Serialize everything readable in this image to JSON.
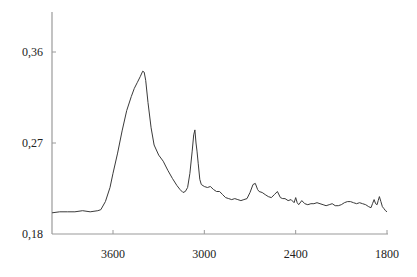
{
  "chart_data": {
    "type": "line",
    "title": "",
    "xlabel": "",
    "ylabel": "",
    "x_reversed": true,
    "xlim": [
      4000,
      1800
    ],
    "ylim": [
      0.18,
      0.39
    ],
    "grid": false,
    "legend": "none",
    "x_ticks": [
      3600,
      3000,
      2400,
      1800
    ],
    "x_tick_labels": [
      "3600",
      "3000",
      "2400",
      "1800"
    ],
    "y_ticks": [
      0.18,
      0.27,
      0.36
    ],
    "y_tick_labels": [
      "0,18",
      "0,27",
      "0,36"
    ],
    "series": [
      {
        "name": "spectrum",
        "x": [
          4000,
          3950,
          3900,
          3850,
          3800,
          3750,
          3700,
          3680,
          3650,
          3620,
          3600,
          3570,
          3540,
          3510,
          3480,
          3460,
          3440,
          3420,
          3405,
          3395,
          3385,
          3370,
          3350,
          3330,
          3300,
          3270,
          3240,
          3210,
          3180,
          3160,
          3140,
          3125,
          3110,
          3095,
          3080,
          3070,
          3062,
          3055,
          3048,
          3040,
          3030,
          3020,
          3000,
          2980,
          2960,
          2940,
          2920,
          2900,
          2880,
          2860,
          2840,
          2820,
          2800,
          2780,
          2760,
          2740,
          2720,
          2700,
          2680,
          2665,
          2650,
          2640,
          2620,
          2600,
          2580,
          2560,
          2540,
          2520,
          2500,
          2485,
          2470,
          2450,
          2430,
          2410,
          2400,
          2390,
          2380,
          2360,
          2340,
          2320,
          2300,
          2280,
          2260,
          2240,
          2220,
          2200,
          2180,
          2160,
          2140,
          2120,
          2100,
          2080,
          2060,
          2040,
          2020,
          2000,
          1980,
          1960,
          1940,
          1920,
          1905,
          1895,
          1885,
          1875,
          1865,
          1858,
          1850,
          1840,
          1830,
          1820,
          1810,
          1800
        ],
        "y": [
          0.201,
          0.202,
          0.202,
          0.202,
          0.203,
          0.202,
          0.203,
          0.204,
          0.212,
          0.226,
          0.24,
          0.26,
          0.282,
          0.302,
          0.316,
          0.324,
          0.33,
          0.336,
          0.341,
          0.34,
          0.332,
          0.31,
          0.285,
          0.268,
          0.258,
          0.252,
          0.243,
          0.235,
          0.228,
          0.224,
          0.221,
          0.222,
          0.226,
          0.24,
          0.262,
          0.278,
          0.283,
          0.27,
          0.262,
          0.25,
          0.234,
          0.229,
          0.227,
          0.226,
          0.227,
          0.224,
          0.222,
          0.222,
          0.219,
          0.216,
          0.215,
          0.214,
          0.215,
          0.214,
          0.213,
          0.214,
          0.215,
          0.221,
          0.229,
          0.23,
          0.224,
          0.222,
          0.221,
          0.219,
          0.217,
          0.216,
          0.219,
          0.222,
          0.216,
          0.215,
          0.215,
          0.213,
          0.214,
          0.211,
          0.216,
          0.211,
          0.209,
          0.213,
          0.21,
          0.209,
          0.21,
          0.21,
          0.211,
          0.21,
          0.209,
          0.208,
          0.209,
          0.21,
          0.208,
          0.208,
          0.209,
          0.211,
          0.212,
          0.212,
          0.211,
          0.21,
          0.211,
          0.21,
          0.209,
          0.207,
          0.206,
          0.21,
          0.214,
          0.21,
          0.209,
          0.213,
          0.217,
          0.212,
          0.207,
          0.205,
          0.203,
          0.202
        ]
      }
    ]
  }
}
